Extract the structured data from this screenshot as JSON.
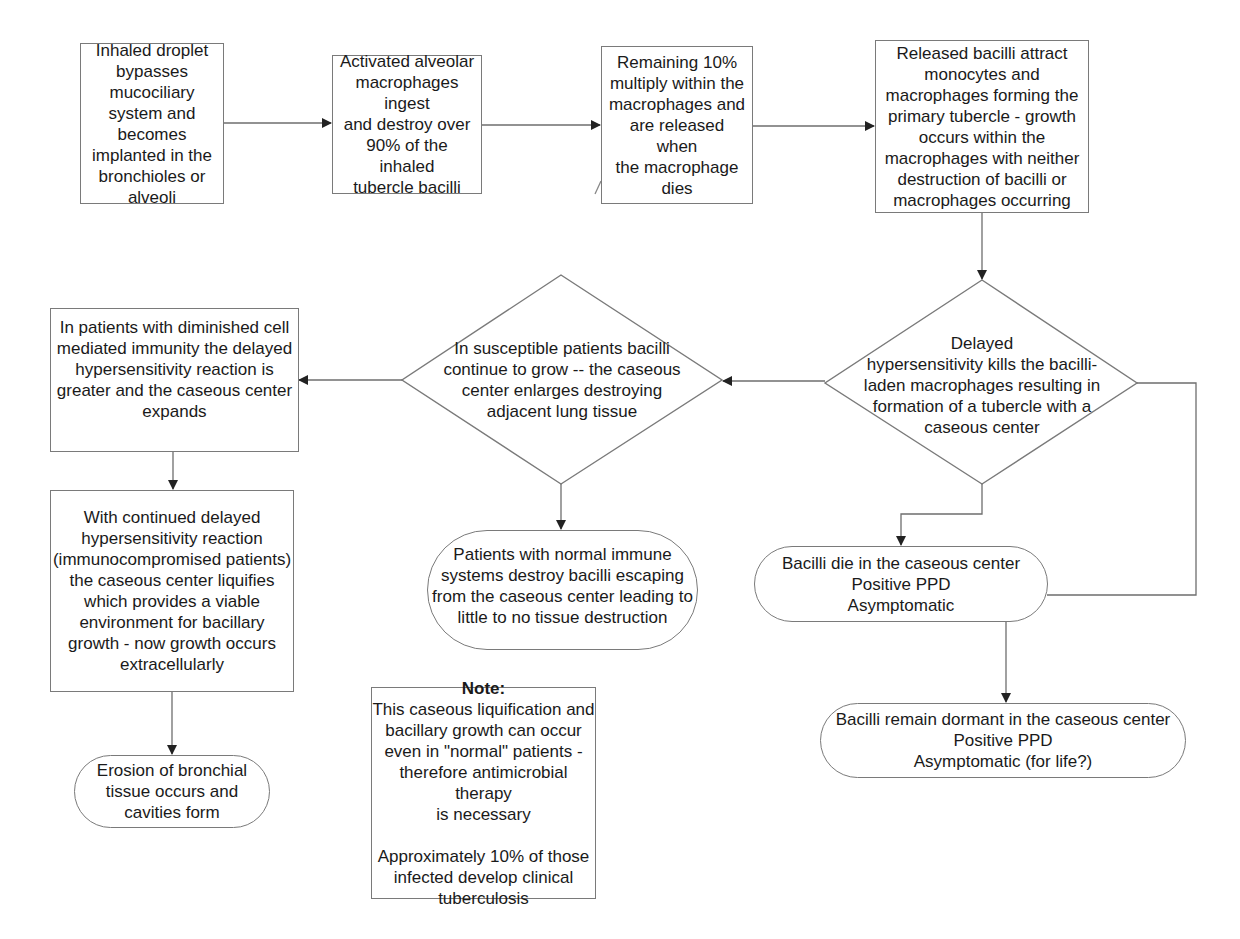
{
  "diagram": {
    "type": "flowchart",
    "nodes": {
      "inhaled": {
        "shape": "process",
        "text": "Inhaled droplet\nbypasses mucociliary\nsystem and becomes\nimplanted in the\nbronchioles or alveoli"
      },
      "macrophages_ingest": {
        "shape": "process",
        "text": "Activated alveolar\nmacrophages ingest\nand destroy over\n90% of the inhaled\ntubercle bacilli"
      },
      "remaining": {
        "shape": "process",
        "text": "Remaining 10%\nmultiply within the\nmacrophages and\nare released when\nthe macrophage\ndies"
      },
      "primary_tubercle": {
        "shape": "process",
        "text": "Released bacilli attract\nmonocytes and\nmacrophages forming the\nprimary tubercle - growth\noccurs within the\nmacrophages with neither\ndestruction of bacilli or\nmacrophages occurring"
      },
      "delayed_hypersensitivity": {
        "shape": "decision",
        "text": "Delayed\nhypersensitivity kills the bacilli-\nladen macrophages resulting in\nformation of a tubercle with a\ncaseous center"
      },
      "susceptible": {
        "shape": "decision",
        "text": "In susceptible patients bacilli\ncontinue to grow --  the caseous\ncenter enlarges destroying\nadjacent lung  tissue"
      },
      "diminished_immunity": {
        "shape": "process",
        "text": "In patients with diminished cell\nmediated immunity the delayed\nhypersensitivity reaction is\ngreater and the caseous center\nexpands"
      },
      "liquifies": {
        "shape": "process",
        "text": "With continued delayed\nhypersensitivity reaction\n(immunocompromised patients)\nthe caseous center liquifies\nwhich provides a viable\nenvironment for bacillary\ngrowth - now growth occurs\nextracellularly"
      },
      "erosion": {
        "shape": "terminal",
        "text": "Erosion of bronchial\ntissue occurs and\ncavities form"
      },
      "normal_immune": {
        "shape": "terminal",
        "text": "Patients with normal immune\nsystems destroy bacilli escaping\nfrom the caseous center leading to\nlittle to no tissue destruction"
      },
      "bacilli_die": {
        "shape": "terminal",
        "text": "Bacilli die in the caseous center\nPositive PPD\nAsymptomatic"
      },
      "dormant": {
        "shape": "terminal",
        "text": "Bacilli remain dormant in the caseous center\nPositive PPD\nAsymptomatic (for life?)"
      }
    },
    "note": {
      "title": "Note:",
      "body": "This caseous liquification and\nbacillary growth can occur\neven in \"normal\" patients -\ntherefore antimicrobial therapy\nis necessary\n\nApproximately 10% of those\ninfected develop clinical\ntuberculosis"
    },
    "edges": [
      {
        "from": "inhaled",
        "to": "macrophages_ingest"
      },
      {
        "from": "macrophages_ingest",
        "to": "remaining"
      },
      {
        "from": "remaining",
        "to": "primary_tubercle"
      },
      {
        "from": "primary_tubercle",
        "to": "delayed_hypersensitivity"
      },
      {
        "from": "delayed_hypersensitivity",
        "to": "susceptible"
      },
      {
        "from": "susceptible",
        "to": "diminished_immunity"
      },
      {
        "from": "diminished_immunity",
        "to": "liquifies"
      },
      {
        "from": "liquifies",
        "to": "erosion"
      },
      {
        "from": "susceptible",
        "to": "normal_immune"
      },
      {
        "from": "delayed_hypersensitivity",
        "to": "bacilli_die"
      },
      {
        "from": "delayed_hypersensitivity",
        "to": "bacilli_die",
        "route": "right-side loop"
      },
      {
        "from": "bacilli_die",
        "to": "dormant"
      }
    ],
    "colors": {
      "line": "#6e6e6e",
      "text": "#1a1a1a",
      "background": "#ffffff"
    }
  }
}
